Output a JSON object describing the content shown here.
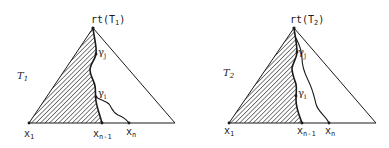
{
  "diagrams": [
    {
      "tree_label": "T",
      "tree_index": "1",
      "root_label": "rt(T",
      "root_index": "1",
      "root_close": ")",
      "node_j": "γ",
      "node_j_index": "j",
      "node_i": "γ",
      "node_i_index": "i",
      "leaf_first": "x",
      "leaf_first_index": "1",
      "leaf_prev": "x",
      "leaf_prev_index": "n-1",
      "leaf_last": "x",
      "leaf_last_index": "n"
    },
    {
      "tree_label": "T",
      "tree_index": "2",
      "root_label": "rt(T",
      "root_index": "2",
      "root_close": ")",
      "node_j": "γ",
      "node_j_index": "j",
      "node_i": "γ",
      "node_i_index": "i",
      "leaf_first": "x",
      "leaf_first_index": "1",
      "leaf_prev": "x",
      "leaf_prev_index": "n-1",
      "leaf_last": "x",
      "leaf_last_index": "n"
    }
  ],
  "colors": {
    "ink": "#1a1a1a",
    "background": "#ffffff"
  }
}
